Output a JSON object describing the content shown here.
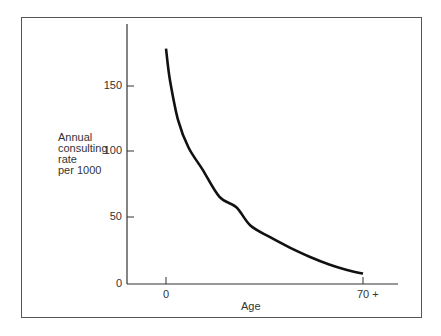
{
  "chart_data": {
    "type": "line",
    "title": "",
    "xlabel": "Age",
    "ylabel": "Annual consulting rate per 1000",
    "ylabel_lines": [
      "Annual",
      "consulting",
      "rate",
      "per 1000"
    ],
    "x_tick_labels": [
      "0",
      "70 +"
    ],
    "y_tick_labels": [
      "0",
      "50",
      "100",
      "150"
    ],
    "y_ticks": [
      0,
      50,
      100,
      150
    ],
    "ylim": [
      0,
      195
    ],
    "xlim": [
      -14,
      82
    ],
    "grid": false,
    "legend": null,
    "series": [
      {
        "name": "Annual consulting rate per 1000",
        "x": [
          0,
          1.4,
          4.3,
          8,
          13,
          19,
          25,
          30,
          37,
          44,
          51,
          58,
          64,
          70
        ],
        "values": [
          181,
          157,
          126,
          105,
          88,
          67,
          59,
          45,
          36,
          28,
          21,
          15,
          11,
          8
        ]
      }
    ],
    "x_tick_positions": [
      0,
      70
    ],
    "line_color": "#111111"
  }
}
